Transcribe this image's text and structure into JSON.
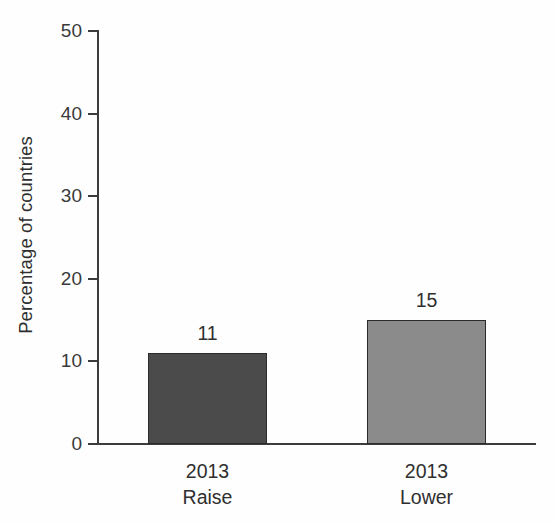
{
  "chart_data": {
    "type": "bar",
    "title": "",
    "subtitle": "",
    "xlabel": "",
    "ylabel": "Percentage of countries",
    "ylim": [
      0,
      50
    ],
    "ytick_labels": [
      "0",
      "10",
      "20",
      "30",
      "40",
      "50"
    ],
    "ytick_values": [
      0,
      10,
      20,
      30,
      40,
      50
    ],
    "grid": false,
    "legend": "none",
    "categories": [
      "2013 Raise",
      "2013 Lower"
    ],
    "category_lines": [
      {
        "line1": "2013",
        "line2": "Raise"
      },
      {
        "line1": "2013",
        "line2": "Lower"
      }
    ],
    "values": [
      11,
      15
    ],
    "value_labels": [
      "11",
      "15"
    ],
    "bar_colors": [
      "#4b4b4b",
      "#8b8b8b"
    ],
    "axis_color": "#3c3c3c",
    "text_color": "#2f2f2f",
    "background": "#fefefe"
  }
}
